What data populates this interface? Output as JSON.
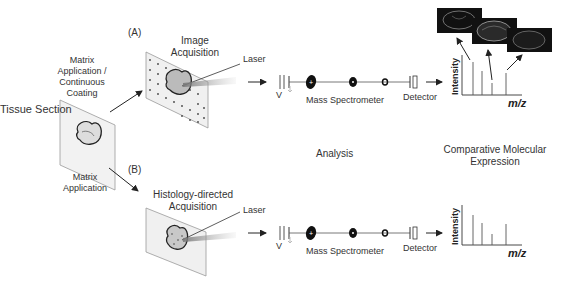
{
  "diagram": {
    "start": {
      "label": "Tissue Section"
    },
    "pathway_a": {
      "tag": "(A)",
      "step1_label": "Matrix Application / Continuous Coating",
      "acquisition_label": "Image Acquisition",
      "laser_label": "Laser",
      "voltage_label": "V",
      "analyzer_label": "Mass Spectrometer",
      "detector_label": "Detector",
      "spectrum": {
        "y_label": "Intensity",
        "x_label": "m/z",
        "peaks": [
          0.82,
          0.6,
          0.3,
          0.55
        ]
      },
      "ion_images": [
        "brain-section-image-1",
        "brain-section-image-2",
        "brain-section-image-3"
      ]
    },
    "pathway_b": {
      "tag": "(B)",
      "step1_label": "Matrix Application",
      "acquisition_label": "Histology-directed Acquisition",
      "laser_label": "Laser",
      "voltage_label": "V",
      "analyzer_label": "Mass Spectrometer",
      "detector_label": "Detector",
      "spectrum": {
        "y_label": "Intensity",
        "x_label": "m/z",
        "peaks": [
          0.88,
          0.7,
          0.38,
          0.7
        ]
      }
    },
    "columns": {
      "analysis": "Analysis",
      "expression": "Comparative Molecular Expression"
    },
    "colors": {
      "line": "#333333",
      "plate": "#f2f2f2",
      "plate_edge": "#999999",
      "image_bg": "#111111"
    }
  }
}
